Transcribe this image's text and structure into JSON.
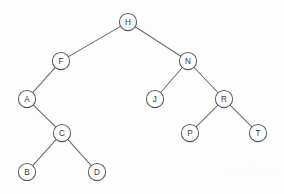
{
  "figure": {
    "type": "binary-search-tree-diagram",
    "title": "",
    "background_color": "#fdfdfd",
    "stroke_color": "#5e5e5e",
    "edge_color": "#6b6b6b",
    "label_color": "#3a3a3a",
    "node_radius": 8.6,
    "width": 284,
    "height": 194
  },
  "tree": {
    "root": "H",
    "nodes": [
      {
        "id": "H",
        "label": "H",
        "x": 128,
        "y": 22,
        "depth": 0,
        "parent": null,
        "side": "root"
      },
      {
        "id": "F",
        "label": "F",
        "x": 61,
        "y": 61,
        "depth": 1,
        "parent": "H",
        "side": "left"
      },
      {
        "id": "N",
        "label": "N",
        "x": 188,
        "y": 61,
        "depth": 1,
        "parent": "H",
        "side": "right"
      },
      {
        "id": "A",
        "label": "A",
        "x": 27,
        "y": 99,
        "depth": 2,
        "parent": "F",
        "side": "left"
      },
      {
        "id": "J",
        "label": "J",
        "x": 155,
        "y": 99,
        "depth": 2,
        "parent": "N",
        "side": "left"
      },
      {
        "id": "R",
        "label": "R",
        "x": 224,
        "y": 99,
        "depth": 2,
        "parent": "N",
        "side": "right"
      },
      {
        "id": "C",
        "label": "C",
        "x": 62,
        "y": 133,
        "depth": 3,
        "parent": "A",
        "side": "right"
      },
      {
        "id": "P",
        "label": "P",
        "x": 190,
        "y": 133,
        "depth": 3,
        "parent": "R",
        "side": "left"
      },
      {
        "id": "T",
        "label": "T",
        "x": 258,
        "y": 133,
        "depth": 3,
        "parent": "R",
        "side": "right"
      },
      {
        "id": "B",
        "label": "B",
        "x": 27,
        "y": 172,
        "depth": 4,
        "parent": "C",
        "side": "left"
      },
      {
        "id": "D",
        "label": "D",
        "x": 97,
        "y": 172,
        "depth": 4,
        "parent": "C",
        "side": "right"
      }
    ],
    "edges": [
      {
        "from": "H",
        "to": "F"
      },
      {
        "from": "H",
        "to": "N"
      },
      {
        "from": "F",
        "to": "A"
      },
      {
        "from": "N",
        "to": "J"
      },
      {
        "from": "N",
        "to": "R"
      },
      {
        "from": "A",
        "to": "C"
      },
      {
        "from": "R",
        "to": "P"
      },
      {
        "from": "R",
        "to": "T"
      },
      {
        "from": "C",
        "to": "B"
      },
      {
        "from": "C",
        "to": "D"
      }
    ]
  },
  "watermark": {
    "text": "ratioleina"
  }
}
